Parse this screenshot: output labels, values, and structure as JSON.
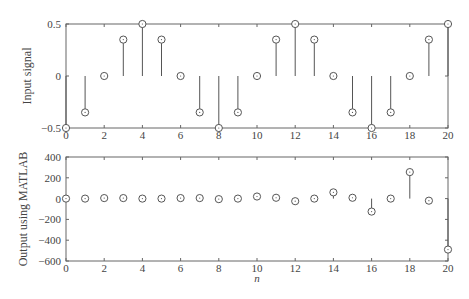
{
  "chart_data": [
    {
      "type": "stem",
      "title": "",
      "xlabel": "",
      "ylabel": "Input signal",
      "x": [
        0,
        1,
        2,
        3,
        4,
        5,
        6,
        7,
        8,
        9,
        10,
        11,
        12,
        13,
        14,
        15,
        16,
        17,
        18,
        19,
        20
      ],
      "values": [
        -0.5,
        -0.35,
        0,
        0.35,
        0.5,
        0.35,
        0,
        -0.35,
        -0.5,
        -0.35,
        0,
        0.35,
        0.5,
        0.35,
        0,
        -0.35,
        -0.5,
        -0.35,
        0,
        0.35,
        0.5
      ],
      "xlim": [
        0,
        20
      ],
      "ylim": [
        -0.5,
        0.5
      ],
      "xticks": [
        "0",
        "2",
        "4",
        "6",
        "8",
        "10",
        "12",
        "14",
        "16",
        "18",
        "20"
      ],
      "yticks": [
        "−0.5",
        "0",
        "0.5"
      ],
      "grid": false
    },
    {
      "type": "stem",
      "title": "",
      "xlabel": "n",
      "ylabel": "Output using MATLAB",
      "x": [
        0,
        1,
        2,
        3,
        4,
        5,
        6,
        7,
        8,
        9,
        10,
        11,
        12,
        13,
        14,
        15,
        16,
        17,
        18,
        19,
        20
      ],
      "values": [
        0,
        0,
        5,
        5,
        0,
        0,
        5,
        5,
        -5,
        0,
        20,
        8,
        -25,
        0,
        60,
        8,
        -125,
        0,
        255,
        -20,
        -490
      ],
      "xlim": [
        0,
        20
      ],
      "ylim": [
        -600,
        400
      ],
      "xticks": [
        "0",
        "2",
        "4",
        "6",
        "8",
        "10",
        "12",
        "14",
        "16",
        "18",
        "20"
      ],
      "yticks": [
        "−600",
        "−400",
        "−200",
        "0",
        "200",
        "400"
      ],
      "grid": false
    }
  ],
  "labels": {
    "top_ylabel": "Input signal",
    "bottom_ylabel": "Output using MATLAB",
    "bottom_xlabel": "n"
  },
  "colors": {
    "axis": "#666666",
    "stem": "#555555",
    "marker": "#555555"
  }
}
